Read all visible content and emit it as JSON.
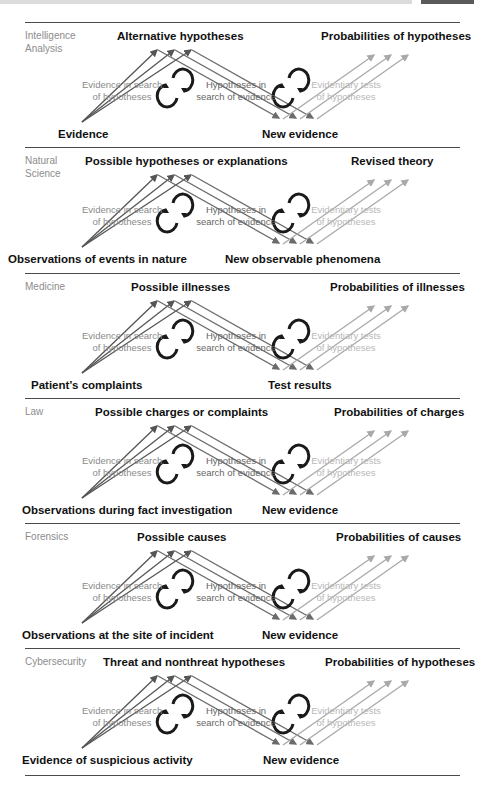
{
  "colors": {
    "dark_arrow": "#555555",
    "mid_arrow": "#6b6b6b",
    "light_arrow": "#a9a9a9",
    "cycle_icon": "#1a1a1a",
    "rule": "#4a4a4a",
    "section_label": "#8c8c8c"
  },
  "common": {
    "evidence_in_search": "Evidence in search",
    "of_hypotheses_1": "of hypotheses",
    "hypotheses_in": "Hypotheses in",
    "search_of_evidence": "search of evidence",
    "evidentiary_tests": "Evidentiary tests",
    "of_hypotheses_2": "of hypotheses"
  },
  "panels": [
    {
      "domain_line1": "Intelligence",
      "domain_line2": "Analysis",
      "hypotheses_label": "Alternative hypotheses",
      "probabilities_label": "Probabilities of hypotheses",
      "start_label": "Evidence",
      "new_label": "New evidence"
    },
    {
      "domain_line1": "Natural",
      "domain_line2": "Science",
      "hypotheses_label": "Possible hypotheses or explanations",
      "probabilities_label": "Revised theory",
      "start_label": "Observations of events in nature",
      "new_label": "New observable phenomena"
    },
    {
      "domain_line1": "Medicine",
      "domain_line2": "",
      "hypotheses_label": "Possible illnesses",
      "probabilities_label": "Probabilities of illnesses",
      "start_label": "Patient’s complaints",
      "new_label": "Test results"
    },
    {
      "domain_line1": "Law",
      "domain_line2": "",
      "hypotheses_label": "Possible charges or complaints",
      "probabilities_label": "Probabilities of charges",
      "start_label": "Observations during fact investigation",
      "new_label": "New evidence"
    },
    {
      "domain_line1": "Forensics",
      "domain_line2": "",
      "hypotheses_label": "Possible causes",
      "probabilities_label": "Probabilities of causes",
      "start_label": "Observations at the site of incident",
      "new_label": "New evidence"
    },
    {
      "domain_line1": "Cybersecurity",
      "domain_line2": "",
      "hypotheses_label": "Threat and nonthreat hypotheses",
      "probabilities_label": "Probabilities of hypotheses",
      "start_label": "Evidence of suspicious activity",
      "new_label": "New evidence"
    }
  ],
  "layout": {
    "panel_tops": [
      22,
      147,
      273,
      398,
      523,
      648
    ],
    "rule_tops": [
      22,
      147,
      273,
      398,
      523,
      648,
      775
    ],
    "hyp_label_x": [
      117,
      85,
      131,
      95,
      137,
      103
    ],
    "prob_label_x": [
      321,
      351,
      330,
      334,
      336,
      325
    ],
    "start_label_x": [
      58,
      8,
      31,
      22,
      22,
      22
    ],
    "new_label_x": [
      262,
      225,
      268,
      262,
      262,
      263
    ]
  }
}
